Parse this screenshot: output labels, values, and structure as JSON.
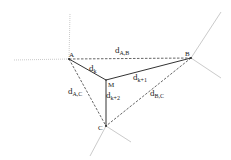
{
  "diagram": {
    "nodes": [
      {
        "id": "A",
        "label": "A"
      },
      {
        "id": "B",
        "label": "B"
      },
      {
        "id": "C",
        "label": "C"
      },
      {
        "id": "M",
        "label": "M"
      }
    ],
    "edges": {
      "AB": {
        "main": "d",
        "sub": "A,B",
        "style": "dashed"
      },
      "AC": {
        "main": "d",
        "sub": "A,C",
        "style": "dashed"
      },
      "BC": {
        "main": "d",
        "sub": "B,C",
        "style": "dashed"
      },
      "AM": {
        "main": "d",
        "sub": "k",
        "style": "solid"
      },
      "BM": {
        "main": "d",
        "sub": "k+1",
        "style": "solid"
      },
      "CM": {
        "main": "d",
        "sub": "k+2",
        "style": "solid"
      }
    },
    "colors": {
      "solid": "#333333",
      "dashed": "#555555",
      "spokes": "#bbbbbb"
    }
  }
}
